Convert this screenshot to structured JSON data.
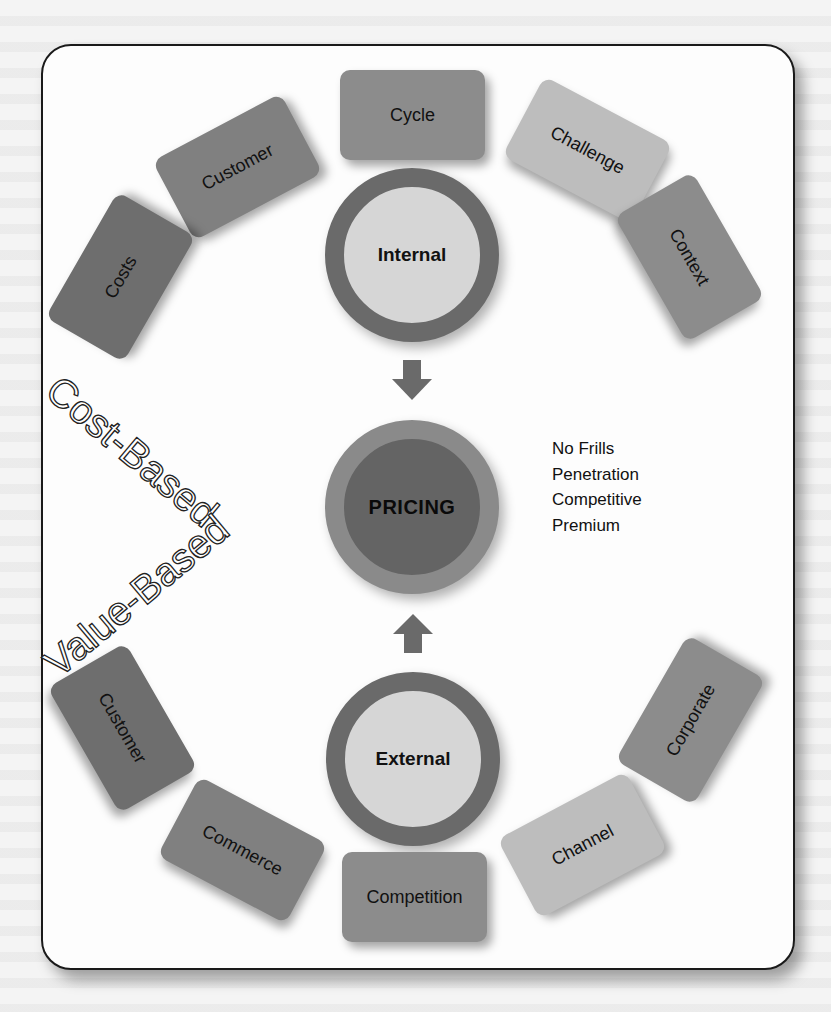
{
  "diagram": {
    "colors": {
      "card_dark": "#6e6e6e",
      "card_mid": "#8c8c8c",
      "card_light": "#bdbdbd",
      "ring_dark": "#6a6a6a",
      "ring_fill_light": "#d6d6d6",
      "pricing_outer": "#8a8a8a",
      "pricing_inner": "#646464",
      "frame_border": "#1a1a1a"
    },
    "internal": {
      "label": "Internal",
      "factors": [
        {
          "label": "Cycle"
        },
        {
          "label": "Challenge"
        },
        {
          "label": "Context"
        },
        {
          "label": "Customer"
        },
        {
          "label": "Costs"
        }
      ]
    },
    "center": {
      "label": "PRICING",
      "strategies": [
        "No Frills",
        "Penetration",
        "Competitive",
        "Premium"
      ]
    },
    "external": {
      "label": "External",
      "factors": [
        {
          "label": "Corporate"
        },
        {
          "label": "Channel"
        },
        {
          "label": "Competition"
        },
        {
          "label": "Commerce"
        },
        {
          "label": "Customer"
        }
      ]
    },
    "approaches": {
      "cost_based": "Cost-Based",
      "value_based": "Value-Based"
    },
    "arrows": {
      "top": "down-arrow",
      "bottom": "up-arrow"
    }
  }
}
